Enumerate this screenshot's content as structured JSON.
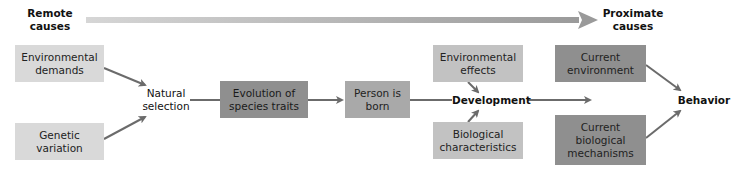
{
  "timeline": {
    "start_label": "Remote\ncauses",
    "end_label": "Proximate\ncauses",
    "colors": {
      "start": "#d4d4d4",
      "end": "#9a9a9a"
    }
  },
  "nodes": {
    "environmental_demands": {
      "label": "Environmental demands",
      "fill": "#d9d9d9"
    },
    "genetic_variation": {
      "label": "Genetic variation",
      "fill": "#d9d9d9"
    },
    "natural_selection": {
      "label": "Natural selection"
    },
    "evolution_species_traits": {
      "label": "Evolution of species traits",
      "fill": "#8f8f8f"
    },
    "person_is_born": {
      "label": "Person is born",
      "fill": "#a9a9a9"
    },
    "environmental_effects": {
      "label": "Environmental effects",
      "fill": "#c2c2c2"
    },
    "development": {
      "label": "Development"
    },
    "biological_characteristics": {
      "label": "Biological characteristics",
      "fill": "#c2c2c2"
    },
    "current_environment": {
      "label": "Current environment",
      "fill": "#8f8f8f"
    },
    "current_biological_mechanisms": {
      "label": "Current biological mechanisms",
      "fill": "#8f8f8f"
    },
    "behavior": {
      "label": "Behavior"
    }
  },
  "edges": [
    {
      "from": "environmental_demands",
      "to": "natural_selection"
    },
    {
      "from": "genetic_variation",
      "to": "natural_selection"
    },
    {
      "from": "natural_selection",
      "to": "evolution_species_traits"
    },
    {
      "from": "evolution_species_traits",
      "to": "person_is_born"
    },
    {
      "from": "person_is_born",
      "to": "development"
    },
    {
      "from": "environmental_effects",
      "to": "development"
    },
    {
      "from": "biological_characteristics",
      "to": "development"
    },
    {
      "from": "development",
      "to": "behavior_stage"
    },
    {
      "from": "current_environment",
      "to": "behavior"
    },
    {
      "from": "current_biological_mechanisms",
      "to": "behavior"
    }
  ],
  "colors": {
    "edge": "#6b6b6b",
    "text": "#1a1a1a"
  }
}
